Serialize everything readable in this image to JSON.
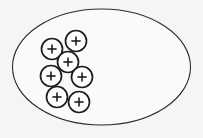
{
  "diagram": {
    "background_color": "#f6f5f3",
    "stroke_color": "#1d1d1d",
    "boundary": {
      "name": "enclosing-ellipse",
      "shape": "ellipse",
      "fill_color": "#fbfaf8",
      "stroke_color": "#2b2b2b",
      "stroke_width": 1.1,
      "cx": 101.5,
      "cy": 67,
      "rx": 89,
      "ry": 58
    },
    "charge": {
      "symbol": "+",
      "sign": "positive",
      "count": 7,
      "radius": 10.5,
      "plus_arm": 4.6,
      "fill_color": "#fdfdfc",
      "stroke_color": "#1d1d1d",
      "stroke_width": 1.7
    },
    "charges": [
      {
        "id": 1,
        "label": "+",
        "cx": 52,
        "cy": 49
      },
      {
        "id": 2,
        "label": "+",
        "cx": 76,
        "cy": 41
      },
      {
        "id": 3,
        "label": "+",
        "cx": 68,
        "cy": 62
      },
      {
        "id": 4,
        "label": "+",
        "cx": 51,
        "cy": 76
      },
      {
        "id": 5,
        "label": "+",
        "cx": 82,
        "cy": 77
      },
      {
        "id": 6,
        "label": "+",
        "cx": 57,
        "cy": 97
      },
      {
        "id": 7,
        "label": "+",
        "cx": 79,
        "cy": 102
      }
    ]
  }
}
